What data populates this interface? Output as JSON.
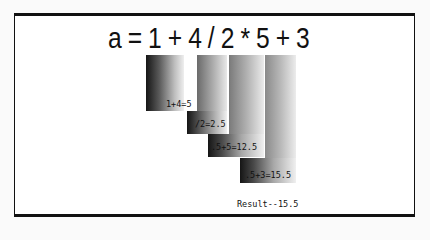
{
  "expression": {
    "label": "a = 1 + 4 / 2 * 5 + 3"
  },
  "steps": [
    {
      "label": "1+4=5",
      "order": 1
    },
    {
      "label": "/2=2.5",
      "order": 2
    },
    {
      "label": ".5+5=12.5",
      "order": 3
    },
    {
      "label": ".5+3=15.5",
      "order": 4
    }
  ],
  "result": {
    "label": "Result--15.5"
  },
  "colors": {
    "frame": "#111111",
    "gradient_dark": "#111111",
    "gradient_light": "#f2f2f2"
  }
}
